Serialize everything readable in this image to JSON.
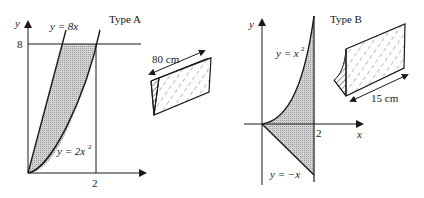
{
  "diagram_a": {
    "title": "Type A",
    "y_axis_label": "y",
    "y_tick": "8",
    "x_tick": "2",
    "curve_line": "y = 8x",
    "curve_parabola_prefix": "y = 2x",
    "curve_parabola_exp": "2",
    "dimension": "80 cm"
  },
  "diagram_b": {
    "title": "Type B",
    "y_axis_label": "y",
    "x_axis_label": "x",
    "x_tick": "2",
    "curve_parabola_prefix": "y = x",
    "curve_parabola_exp": "2",
    "curve_line": "y = −x",
    "dimension": "15 cm"
  },
  "colors": {
    "ink": "#1a1a1a",
    "shade": "#c8c8c8"
  }
}
